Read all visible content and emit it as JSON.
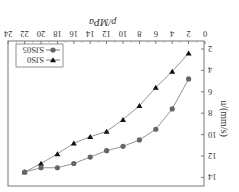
{
  "figure": {
    "rotation_deg": 180,
    "background": "#ffffff"
  },
  "chart_data": {
    "type": "line",
    "title": "",
    "xlabel": "p/MPa",
    "ylabel": "u/(mm/s)",
    "xlim": [
      0,
      24
    ],
    "ylim": [
      2,
      14
    ],
    "x_ticks": [
      "0",
      "2",
      "4",
      "6",
      "8",
      "10",
      "12",
      "14",
      "16",
      "18",
      "20",
      "22",
      "24"
    ],
    "y_ticks": [
      "2",
      "4",
      "6",
      "8",
      "10",
      "12",
      "14"
    ],
    "grid": false,
    "legend_position": "upper-left (in unrotated frame)",
    "x": [
      2,
      4,
      6,
      8,
      10,
      12,
      14,
      16,
      18,
      20,
      22
    ],
    "series": [
      {
        "name": "SJS0",
        "marker": "triangle-down",
        "color": "#111111",
        "line_color": "#888888",
        "values": [
          2.4,
          4.1,
          5.6,
          7.3,
          8.6,
          9.7,
          10.2,
          10.8,
          11.8,
          12.7,
          13.5
        ]
      },
      {
        "name": "SJS05",
        "marker": "circle",
        "color": "#666666",
        "line_color": "#888888",
        "values": [
          4.8,
          7.6,
          9.5,
          10.5,
          11.1,
          11.5,
          12.1,
          12.7,
          13.1,
          13.1,
          13.5
        ]
      }
    ]
  }
}
